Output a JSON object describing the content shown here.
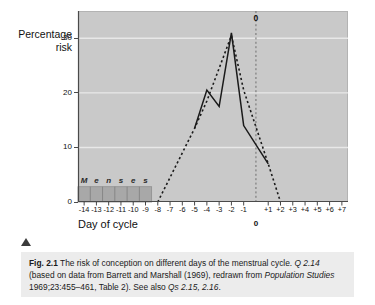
{
  "figure": {
    "y_axis_label": "Percentage risk",
    "x_axis_title": "Day of cycle",
    "zero_marker_top": "0",
    "zero_marker_bottom": "0",
    "menses_letters": [
      "M",
      "e",
      "n",
      "s",
      "e",
      "s"
    ],
    "colors": {
      "plot_background": "#c9c9c9",
      "menses_bar": "#a8a8a8",
      "gridline": "#e8e8e8",
      "curve": "#1a1a1a",
      "caption_background": "#ececec"
    }
  },
  "caption": {
    "figure_number": "Fig. 2.1",
    "text_1": "The risk of conception on different days of the menstrual cycle. ",
    "ref_1": "Q 2.14",
    "text_2": " (based on data from Barrett and Marshall (1969), redrawn from ",
    "journal": "Population Studies",
    "text_3": " 1969;23:455–461, Table 2). See also ",
    "ref_2": "Qs 2.15, 2.16",
    "text_4": "."
  },
  "chart_data": {
    "type": "line",
    "title": "The risk of conception on different days of the menstrual cycle",
    "xlabel": "Day of cycle",
    "ylabel": "Percentage risk",
    "xlim": [
      -14.5,
      7.5
    ],
    "ylim": [
      0,
      35
    ],
    "yticks": [
      0,
      10,
      20,
      30
    ],
    "xticks": [
      "-14",
      "-13",
      "-12",
      "-11",
      "-10",
      "-9",
      "-8",
      "-7",
      "-6",
      "-5",
      "-4",
      "-3",
      "-2",
      "-1",
      "+1",
      "+2",
      "+3",
      "+4",
      "+5",
      "+6",
      "+7"
    ],
    "xtick_values": [
      -14,
      -13,
      -12,
      -11,
      -10,
      -9,
      -8,
      -7,
      -6,
      -5,
      -4,
      -3,
      -2,
      -1,
      1,
      2,
      3,
      4,
      5,
      6,
      7
    ],
    "grid": true,
    "grid_axis": "y",
    "legend": "none",
    "series": [
      {
        "name": "observed risk (solid)",
        "style": "solid",
        "x": [
          -5,
          -4,
          -3,
          -2,
          -1,
          1
        ],
        "values": [
          13.5,
          20.5,
          17.5,
          31,
          14,
          7
        ]
      },
      {
        "name": "fitted trend (dashed)",
        "style": "dashed",
        "x": [
          -8,
          -7,
          -6,
          -5,
          -4,
          -3,
          -2,
          -1,
          1,
          2
        ],
        "values": [
          0,
          4.5,
          9.0,
          13.5,
          18.5,
          24.5,
          30.5,
          20.5,
          7,
          0
        ]
      }
    ],
    "annotations": [
      {
        "label": "0",
        "type": "vertical-dashed-line",
        "x": 0
      },
      {
        "label": "Menses",
        "type": "band",
        "x_start": -14.5,
        "x_end": -8.5,
        "height": 2.8
      }
    ]
  }
}
